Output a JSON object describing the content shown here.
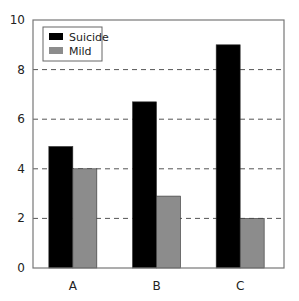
{
  "chart_data": {
    "type": "bar",
    "title": "",
    "xlabel": "",
    "ylabel": "",
    "categories": [
      "A",
      "B",
      "C"
    ],
    "series": [
      {
        "name": "Suicide",
        "color": "#000000",
        "values": [
          4.9,
          6.7,
          9.0
        ]
      },
      {
        "name": "Mild",
        "color": "#8c8c8c",
        "values": [
          4.0,
          2.9,
          2.0
        ]
      }
    ],
    "ylim": [
      0,
      10
    ],
    "yticks": [
      0,
      2,
      4,
      6,
      8,
      10
    ],
    "grid": "horizontal dashed",
    "legend_position": "upper left"
  }
}
